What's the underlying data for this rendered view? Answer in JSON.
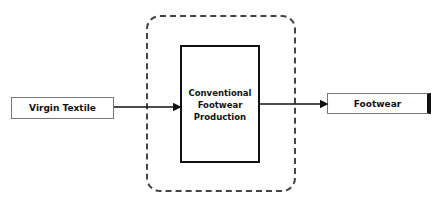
{
  "diagram": {
    "nodes": [
      {
        "id": "virgin-textile",
        "label": "Virgin Textile"
      },
      {
        "id": "process",
        "label": "Conventional Footwear Production"
      },
      {
        "id": "footwear",
        "label": "Footwear"
      }
    ],
    "edges": [
      {
        "from": "virgin-textile",
        "to": "process"
      },
      {
        "from": "process",
        "to": "footwear"
      }
    ],
    "boundary": {
      "style": "dashed rounded",
      "encloses": "process"
    }
  },
  "labels": {
    "source": "Virgin Textile",
    "process": "Conventional Footwear Production",
    "output": "Footwear"
  }
}
